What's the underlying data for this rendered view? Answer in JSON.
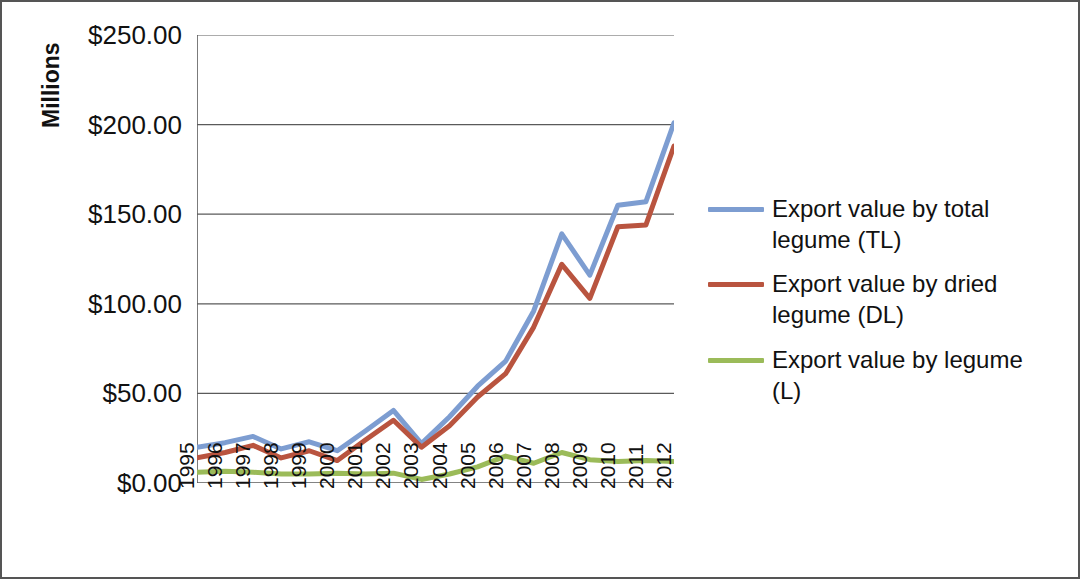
{
  "axes": {
    "y_axis_title": "Millions",
    "y_tick_labels": [
      "$250.00",
      "$200.00",
      "$150.00",
      "$100.00",
      "$50.00",
      "$0.00"
    ],
    "x_tick_labels": [
      "1995",
      "1996",
      "1997",
      "1998",
      "1999",
      "2000",
      "2001",
      "2002",
      "2003",
      "2004",
      "2005",
      "2006",
      "2007",
      "2008",
      "2009",
      "2010",
      "2011",
      "2012"
    ]
  },
  "legend": {
    "items": [
      {
        "label": "Export value by total legume (TL)",
        "color": "#7D9DD1"
      },
      {
        "label": "Export value by dried legume (DL)",
        "color": "#B9543F"
      },
      {
        "label": "Export value by legume (L)",
        "color": "#9BBB59"
      }
    ]
  },
  "chart_data": {
    "type": "line",
    "title": "",
    "xlabel": "",
    "ylabel": "Millions",
    "ylim": [
      0,
      250
    ],
    "ytick_values": [
      0,
      50,
      100,
      150,
      200,
      250
    ],
    "grid": true,
    "legend_position": "right",
    "categories": [
      "1995",
      "1996",
      "1997",
      "1998",
      "1999",
      "2000",
      "2001",
      "2002",
      "2003",
      "2004",
      "2005",
      "2006",
      "2007",
      "2008",
      "2009",
      "2010",
      "2011",
      "2012"
    ],
    "series": [
      {
        "name": "Export value by total legume (TL)",
        "color": "#7D9DD1",
        "values": [
          20.0,
          22.5,
          26.0,
          19.0,
          23.0,
          18.0,
          29.0,
          40.5,
          22.0,
          37.0,
          54.0,
          68.0,
          96.0,
          139.0,
          116.0,
          155.0,
          157.0,
          201.0
        ]
      },
      {
        "name": "Export value by dried legume (DL)",
        "color": "#B9543F",
        "values": [
          14.0,
          17.0,
          21.0,
          14.0,
          18.0,
          12.5,
          24.0,
          35.0,
          20.0,
          32.0,
          48.0,
          61.0,
          87.0,
          122.0,
          103.0,
          143.0,
          144.0,
          188.0
        ]
      },
      {
        "name": "Export value by legume (L)",
        "color": "#9BBB59",
        "values": [
          6.0,
          6.5,
          6.0,
          5.0,
          5.0,
          5.5,
          5.0,
          5.5,
          2.0,
          5.0,
          9.0,
          15.0,
          11.0,
          17.0,
          13.0,
          12.0,
          12.5,
          12.0
        ]
      }
    ]
  }
}
